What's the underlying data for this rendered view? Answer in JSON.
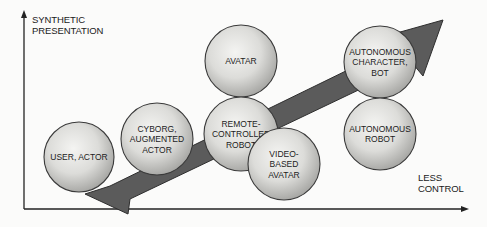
{
  "axes": {
    "y_label_line1": "SYNTHETIC",
    "y_label_line2": "PRESENTATION",
    "x_label_line1": "LESS",
    "x_label_line2": "CONTROL"
  },
  "nodes": [
    {
      "id": "user-actor",
      "lines": [
        "USER,  ACTOR"
      ],
      "cx": 79,
      "cy": 157,
      "r": 35
    },
    {
      "id": "cyborg",
      "lines": [
        "CYBORG,",
        "AUGMENTED",
        "ACTOR"
      ],
      "cx": 157,
      "cy": 139,
      "r": 36
    },
    {
      "id": "avatar",
      "lines": [
        "AVATAR"
      ],
      "cx": 241,
      "cy": 61,
      "r": 36
    },
    {
      "id": "remote-robot",
      "lines": [
        "REMOTE-",
        "CONTROLLED",
        "ROBOT"
      ],
      "cx": 241,
      "cy": 134,
      "r": 37
    },
    {
      "id": "video-avatar",
      "lines": [
        "VIDEO-",
        "BASED",
        "AVATAR"
      ],
      "cx": 284,
      "cy": 164,
      "r": 36
    },
    {
      "id": "autonomous-character",
      "lines": [
        "AUTONOMOUS",
        "CHARACTER,",
        "BOT"
      ],
      "cx": 380,
      "cy": 62,
      "r": 36
    },
    {
      "id": "autonomous-robot",
      "lines": [
        "AUTONOMOUS",
        "ROBOT"
      ],
      "cx": 380,
      "cy": 134,
      "r": 36
    }
  ],
  "colors": {
    "arrow_fill": "#5a5a5a",
    "arrow_stroke": "#2a2a2a",
    "circle_light": "#eeeeec",
    "circle_dark": "#a9a9a6",
    "circle_stroke": "#3a3a3a",
    "axis": "#222222"
  }
}
